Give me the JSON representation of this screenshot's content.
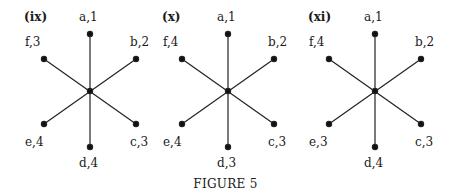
{
  "figure": {
    "caption": "FIGURE 5",
    "panels": [
      {
        "id": "(ix)",
        "nodes": {
          "a": "a,1",
          "b": "b,2",
          "c": "c,3",
          "d": "d,4",
          "e": "e,4",
          "f": "f,3"
        }
      },
      {
        "id": "(x)",
        "nodes": {
          "a": "a,1",
          "b": "b,2",
          "c": "c,3",
          "d": "d,3",
          "e": "e,4",
          "f": "f,4"
        }
      },
      {
        "id": "(xi)",
        "nodes": {
          "a": "a,1",
          "b": "b,2",
          "c": "c,3",
          "d": "d,4",
          "e": "e,3",
          "f": "f,4"
        }
      }
    ]
  }
}
